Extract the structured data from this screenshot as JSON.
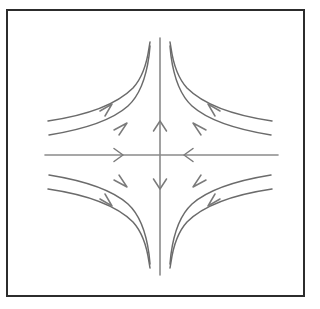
{
  "figure": {
    "type": "phase-portrait",
    "equilibrium_type": "saddle-point",
    "background_color": "#ffffff",
    "frame_color": "#2c2c2c",
    "axis_color": "#8a8a8a",
    "trajectory_color": "#6b6b6b",
    "arrow_color": "#7a7a7a",
    "frame": {
      "x": 6,
      "y": 9,
      "width": 299,
      "height": 288
    },
    "origin": {
      "x": 160,
      "y": 155
    },
    "axes": {
      "horizontal": {
        "name": "horizontal-axis",
        "x_start": 45,
        "x_end": 278,
        "y": 155,
        "stability": "stable",
        "arrows": [
          {
            "x": 122,
            "y": 155,
            "direction": "right"
          },
          {
            "x": 185,
            "y": 155,
            "direction": "left"
          }
        ]
      },
      "vertical": {
        "name": "vertical-axis",
        "y_start": 38,
        "y_end": 275,
        "x": 160,
        "stability": "unstable",
        "arrows": [
          {
            "x": 160,
            "y": 122,
            "direction": "up"
          },
          {
            "x": 160,
            "y": 188,
            "direction": "down"
          }
        ]
      }
    },
    "trajectories": [
      {
        "quadrant": "upper-left",
        "index": 0,
        "arrow_direction": "up-right"
      },
      {
        "quadrant": "upper-left",
        "index": 1,
        "arrow_direction": "up-right"
      },
      {
        "quadrant": "upper-right",
        "index": 0,
        "arrow_direction": "up-left"
      },
      {
        "quadrant": "upper-right",
        "index": 1,
        "arrow_direction": "up-left"
      },
      {
        "quadrant": "lower-left",
        "index": 0,
        "arrow_direction": "down-right"
      },
      {
        "quadrant": "lower-left",
        "index": 1,
        "arrow_direction": "down-right"
      },
      {
        "quadrant": "lower-right",
        "index": 0,
        "arrow_direction": "down-left"
      },
      {
        "quadrant": "lower-right",
        "index": 1,
        "arrow_direction": "down-left"
      }
    ]
  },
  "chart_data": {
    "type": "line",
    "title": "",
    "subtitle": "",
    "xlabel": "",
    "ylabel": "",
    "grid": false,
    "legend": "none",
    "xlim": [
      -4,
      4
    ],
    "ylim": [
      -4,
      4
    ],
    "description": "Saddle point phase portrait: hyperbolic trajectories xy = const in four quadrants; horizontal axis arrows point inward toward the origin (stable manifold), vertical axis arrows point outward away from the origin (unstable manifold).",
    "series": [
      {
        "name": "upper-left-outer",
        "quadrant": "upper-left",
        "points": [
          [
            -3.6,
            0.55
          ],
          [
            -3.0,
            0.66
          ],
          [
            -2.4,
            0.83
          ],
          [
            -1.8,
            1.1
          ],
          [
            -1.4,
            1.42
          ],
          [
            -1.1,
            1.8
          ],
          [
            -0.9,
            2.2
          ],
          [
            -0.78,
            2.55
          ],
          [
            -0.7,
            2.85
          ],
          [
            -0.65,
            3.05
          ]
        ],
        "arrow_at": [
          -1.55,
          1.28
        ],
        "arrow_direction": "up-right"
      },
      {
        "name": "upper-left-inner",
        "quadrant": "upper-left",
        "points": [
          [
            -3.6,
            0.28
          ],
          [
            -3.0,
            0.34
          ],
          [
            -2.4,
            0.43
          ],
          [
            -1.8,
            0.57
          ],
          [
            -1.3,
            0.79
          ],
          [
            -1.0,
            1.03
          ],
          [
            -0.78,
            1.32
          ],
          [
            -0.62,
            1.66
          ],
          [
            -0.5,
            2.06
          ],
          [
            -0.42,
            2.45
          ],
          [
            -0.38,
            2.85
          ],
          [
            -0.35,
            3.05
          ]
        ],
        "arrow_at": [
          -1.05,
          0.98
        ],
        "arrow_direction": "up-right"
      },
      {
        "name": "upper-right-inner",
        "quadrant": "upper-right",
        "points": [
          [
            0.35,
            3.05
          ],
          [
            0.38,
            2.85
          ],
          [
            0.42,
            2.45
          ],
          [
            0.5,
            2.06
          ],
          [
            0.62,
            1.66
          ],
          [
            0.78,
            1.32
          ],
          [
            1.0,
            1.03
          ],
          [
            1.3,
            0.79
          ],
          [
            1.8,
            0.57
          ],
          [
            2.4,
            0.43
          ],
          [
            3.0,
            0.34
          ],
          [
            3.5,
            0.28
          ]
        ],
        "arrow_at": [
          1.05,
          0.98
        ],
        "arrow_direction": "up-left"
      },
      {
        "name": "upper-right-outer",
        "quadrant": "upper-right",
        "points": [
          [
            0.65,
            3.05
          ],
          [
            0.7,
            2.85
          ],
          [
            0.78,
            2.55
          ],
          [
            0.9,
            2.2
          ],
          [
            1.1,
            1.8
          ],
          [
            1.4,
            1.42
          ],
          [
            1.8,
            1.1
          ],
          [
            2.4,
            0.83
          ],
          [
            3.0,
            0.66
          ],
          [
            3.55,
            0.55
          ]
        ],
        "arrow_at": [
          1.55,
          1.28
        ],
        "arrow_direction": "up-left"
      },
      {
        "name": "lower-left-outer",
        "quadrant": "lower-left",
        "points": [
          [
            -3.6,
            -0.28
          ],
          [
            -3.0,
            -0.34
          ],
          [
            -2.4,
            -0.43
          ],
          [
            -1.8,
            -0.57
          ],
          [
            -1.3,
            -0.79
          ],
          [
            -1.0,
            -1.03
          ],
          [
            -0.78,
            -1.32
          ],
          [
            -0.62,
            -1.66
          ],
          [
            -0.5,
            -2.06
          ],
          [
            -0.42,
            -2.45
          ],
          [
            -0.38,
            -2.85
          ],
          [
            -0.35,
            -3.05
          ]
        ],
        "arrow_at": [
          -1.05,
          -0.98
        ],
        "arrow_direction": "down-right"
      },
      {
        "name": "lower-left-inner",
        "quadrant": "lower-left",
        "points": [
          [
            -3.6,
            -0.55
          ],
          [
            -3.0,
            -0.66
          ],
          [
            -2.4,
            -0.83
          ],
          [
            -1.8,
            -1.1
          ],
          [
            -1.4,
            -1.42
          ],
          [
            -1.1,
            -1.8
          ],
          [
            -0.9,
            -2.2
          ],
          [
            -0.78,
            -2.55
          ],
          [
            -0.7,
            -2.85
          ],
          [
            -0.65,
            -3.05
          ]
        ],
        "arrow_at": [
          -1.55,
          -1.28
        ],
        "arrow_direction": "down-right"
      },
      {
        "name": "lower-right-inner",
        "quadrant": "lower-right",
        "points": [
          [
            0.35,
            -3.05
          ],
          [
            0.38,
            -2.85
          ],
          [
            0.42,
            -2.45
          ],
          [
            0.5,
            -2.06
          ],
          [
            0.62,
            -1.66
          ],
          [
            0.78,
            -1.32
          ],
          [
            1.0,
            -1.03
          ],
          [
            1.3,
            -0.79
          ],
          [
            1.8,
            -0.57
          ],
          [
            2.4,
            -0.43
          ],
          [
            3.0,
            -0.34
          ],
          [
            3.5,
            -0.28
          ]
        ],
        "arrow_at": [
          1.05,
          -0.98
        ],
        "arrow_direction": "down-left"
      },
      {
        "name": "lower-right-outer",
        "quadrant": "lower-right",
        "points": [
          [
            0.65,
            -3.05
          ],
          [
            0.7,
            -2.85
          ],
          [
            0.78,
            -2.55
          ],
          [
            0.9,
            -2.2
          ],
          [
            1.1,
            -1.8
          ],
          [
            1.4,
            -1.42
          ],
          [
            1.8,
            -1.1
          ],
          [
            2.4,
            -0.83
          ],
          [
            3.0,
            -0.66
          ],
          [
            3.55,
            -0.55
          ]
        ],
        "arrow_at": [
          1.55,
          -1.28
        ],
        "arrow_direction": "down-left"
      }
    ]
  }
}
